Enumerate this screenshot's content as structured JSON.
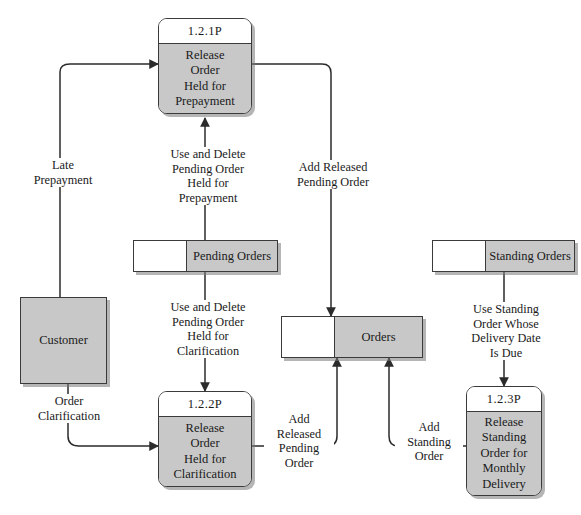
{
  "diagram": {
    "type": "data-flow-diagram",
    "colors": {
      "fill_gray": "#c8c8c8",
      "stroke": "#3a3a3a",
      "background": "#ffffff",
      "shadow": "#787878"
    },
    "processes": [
      {
        "id": "1.2.1P",
        "name": "Release\nOrder\nHeld for\nPrepayment"
      },
      {
        "id": "1.2.2P",
        "name": "Release\nOrder\nHeld for\nClarification"
      },
      {
        "id": "1.2.3P",
        "name": "Release\nStanding\nOrder for\nMonthly\nDelivery"
      }
    ],
    "entities": [
      {
        "name": "Customer"
      }
    ],
    "data_stores": [
      {
        "name": "Pending Orders"
      },
      {
        "name": "Orders"
      },
      {
        "name": "Standing Orders"
      }
    ],
    "flows": [
      {
        "label": "Late\nPrepayment"
      },
      {
        "label": "Use and Delete\nPending Order\nHeld for\nPrepayment"
      },
      {
        "label": "Add Released\nPending Order"
      },
      {
        "label": "Use and Delete\nPending Order\nHeld for\nClarification"
      },
      {
        "label": "Use Standing\nOrder Whose\nDelivery Date\nIs Due"
      },
      {
        "label": "Order\nClarification"
      },
      {
        "label": "Add\nReleased\nPending\nOrder"
      },
      {
        "label": "Add\nStanding\nOrder"
      }
    ]
  }
}
